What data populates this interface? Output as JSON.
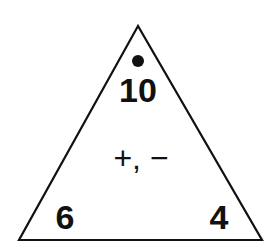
{
  "diagram": {
    "type": "fact-family-triangle",
    "top_number": "10",
    "bottom_left_number": "6",
    "bottom_right_number": "4",
    "operations": "+, −",
    "marker": "dot",
    "colors": {
      "stroke": "#111111",
      "background": "#ffffff"
    }
  }
}
